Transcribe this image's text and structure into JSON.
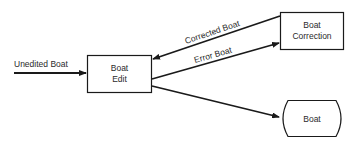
{
  "diagram": {
    "nodes": [
      {
        "id": "boat-edit",
        "shape": "rectangle",
        "lines": [
          "Boat",
          "Edit"
        ]
      },
      {
        "id": "boat-correction",
        "shape": "rectangle",
        "lines": [
          "Boat",
          "Correction"
        ]
      },
      {
        "id": "boat",
        "shape": "storage",
        "lines": [
          "Boat"
        ]
      }
    ],
    "edges": [
      {
        "from": "external",
        "to": "boat-edit",
        "label": "Unedited Boat"
      },
      {
        "from": "boat-correction",
        "to": "boat-edit",
        "label": "Corrected Boat"
      },
      {
        "from": "boat-edit",
        "to": "boat-correction",
        "label": "Error Boat"
      },
      {
        "from": "boat-edit",
        "to": "boat",
        "label": ""
      }
    ]
  },
  "colors": {
    "stroke": "#1a1a1a",
    "text": "#2a2a2a",
    "background": "#ffffff"
  }
}
